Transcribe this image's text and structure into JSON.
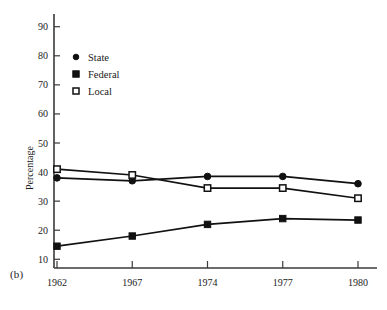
{
  "figure": {
    "panel_label": "(b)",
    "ylabel": "Percentage"
  },
  "legend": {
    "position": "top-left-inside",
    "entries": [
      {
        "label": "State",
        "marker": "filled-circle-icon",
        "color": "#111111"
      },
      {
        "label": "Federal",
        "marker": "filled-square-icon",
        "color": "#111111"
      },
      {
        "label": "Local",
        "marker": "open-square-icon",
        "color": "#111111"
      }
    ]
  },
  "chart_data": {
    "type": "line",
    "title": "",
    "xlabel": "",
    "ylabel": "Percentage",
    "categories": [
      "1962",
      "1967",
      "1974",
      "1977",
      "1980"
    ],
    "x": [
      1962,
      1967,
      1974,
      1977,
      1980
    ],
    "xtick_labels": [
      "1962",
      "1967",
      "1974",
      "1977",
      "1980"
    ],
    "ytick_labels": [
      "10",
      "20",
      "30",
      "40",
      "50",
      "60",
      "70",
      "80",
      "90"
    ],
    "yticks": [
      10,
      20,
      30,
      40,
      50,
      60,
      70,
      80,
      90
    ],
    "ylim": [
      7,
      93
    ],
    "grid": false,
    "legend_position": "upper left",
    "series": [
      {
        "name": "State",
        "marker": "filled-circle",
        "color": "#111111",
        "values": [
          38,
          37,
          38.5,
          38.5,
          36
        ]
      },
      {
        "name": "Federal",
        "marker": "filled-square",
        "color": "#111111",
        "values": [
          14.5,
          18,
          22,
          24,
          23.5
        ]
      },
      {
        "name": "Local",
        "marker": "open-square",
        "color": "#111111",
        "values": [
          41,
          39,
          34.5,
          34.5,
          31
        ]
      }
    ]
  }
}
